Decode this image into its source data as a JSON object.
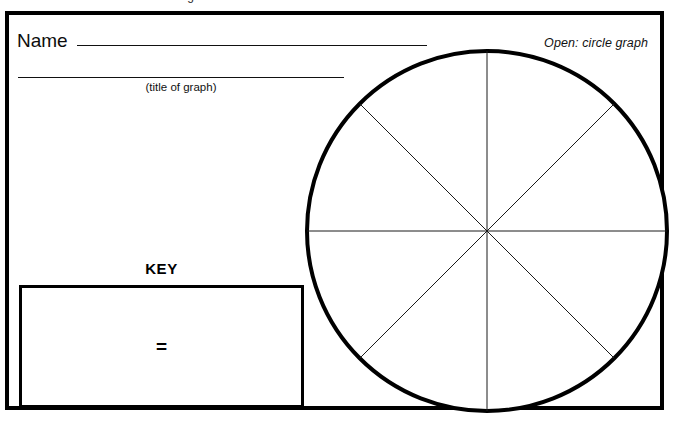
{
  "document": {
    "kind": "worksheet",
    "background_color": "#ffffff",
    "ink_color": "#000000",
    "cut_off_text_above": "descenders of a cut-off heading line"
  },
  "header": {
    "name_label": "Name",
    "name_value": "",
    "name_placeholder": "",
    "open_label": "Open: circle graph"
  },
  "title_field": {
    "value": "",
    "placeholder": "",
    "caption": "(title of graph)"
  },
  "key": {
    "heading": "KEY",
    "equals_symbol": "=",
    "left_value": "",
    "right_value": ""
  },
  "chart_data": {
    "type": "pie",
    "title": "",
    "subtitle": "",
    "xlabel": "",
    "ylabel": "",
    "legend_position": "left",
    "grid": false,
    "blank_template": true,
    "sectors": 8,
    "categories": [
      "1",
      "2",
      "3",
      "4",
      "5",
      "6",
      "7",
      "8"
    ],
    "values": [
      12.5,
      12.5,
      12.5,
      12.5,
      12.5,
      12.5,
      12.5,
      12.5
    ],
    "labels": [
      "",
      "",
      "",
      "",
      "",
      "",
      "",
      ""
    ],
    "divider_angles_deg": [
      0,
      45,
      90,
      135,
      180,
      225,
      270,
      315
    ],
    "radius_px": 180,
    "center_px": [
      477,
      228
    ],
    "outline_color": "#000000",
    "outline_width_px": 4,
    "divider_color": "#1a1a1a",
    "divider_width_px": 1,
    "fill_color": "#ffffff",
    "annotations": []
  }
}
